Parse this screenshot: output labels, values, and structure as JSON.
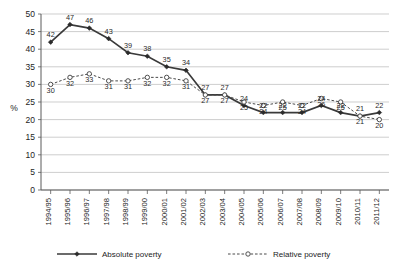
{
  "chart_data": {
    "type": "line",
    "title": "",
    "xlabel": "",
    "ylabel": "%",
    "ylim": [
      0,
      50
    ],
    "ytick_step": 5,
    "yticks": [
      0,
      5,
      10,
      15,
      20,
      25,
      30,
      35,
      40,
      45,
      50
    ],
    "grid": true,
    "legend_position": "bottom",
    "categories": [
      "1994/95",
      "1995/96",
      "1996/97",
      "1997/98",
      "1998/99",
      "1999/00",
      "2000/01",
      "2001/02",
      "2002/03",
      "2003/04",
      "2004/05",
      "2005/06",
      "2006/07",
      "2007/08",
      "2008/09",
      "2009/10",
      "2010/11",
      "2011/12"
    ],
    "series": [
      {
        "name": "Absolute poverty",
        "marker": "filled-diamond",
        "style": "solid",
        "color": "#3a3a3a",
        "values": [
          42,
          47,
          46,
          43,
          39,
          38,
          35,
          34,
          27,
          27,
          24,
          22,
          22,
          22,
          24,
          22,
          21,
          22
        ]
      },
      {
        "name": "Relative poverty",
        "marker": "open-circle",
        "style": "dashed",
        "color": "#4a4a4a",
        "values": [
          30,
          32,
          33,
          31,
          31,
          32,
          32,
          31,
          27,
          27,
          25,
          24,
          25,
          24,
          26,
          25,
          21,
          20
        ]
      }
    ]
  },
  "legend": {
    "items": [
      {
        "label": "Absolute poverty"
      },
      {
        "label": "Relative poverty"
      }
    ]
  },
  "axes": {
    "y_axis_title": "%"
  }
}
